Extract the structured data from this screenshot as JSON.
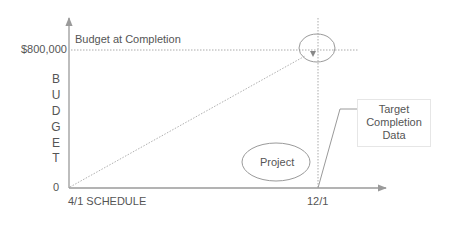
{
  "diagram": {
    "title_label": "Budget at Completion",
    "y_axis": {
      "label_letters": [
        "B",
        "U",
        "D",
        "G",
        "E",
        "T"
      ],
      "top_value": "$800,000",
      "bottom_value": "0"
    },
    "x_axis": {
      "start_label": "4/1 SCHEDULE",
      "end_label": "12/1"
    },
    "project_label": "Project",
    "callout": {
      "lines": [
        "Target",
        "Completion",
        "Data"
      ]
    },
    "colors": {
      "line": "#9a9a9a",
      "text": "#555555"
    }
  }
}
